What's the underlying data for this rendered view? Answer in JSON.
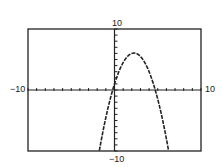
{
  "chart_data": {
    "type": "line",
    "title": "",
    "xlabel": "",
    "ylabel": "",
    "xlim": [
      -10,
      10
    ],
    "ylim": [
      -10,
      10
    ],
    "xscale_tick": 1,
    "yscale_tick": 1,
    "grid": false,
    "legend": null,
    "labels": {
      "xmin": "−10",
      "xmax": "10",
      "ymin": "−10",
      "ymax": "10"
    },
    "series": [
      {
        "name": "f(x)",
        "style": "dashed-pixel",
        "description": "Downward-opening parabola, vertex approx (2.25, 6.06), x-intercepts approx -0.25 and 4.75",
        "x": [
          -1.8,
          -1,
          -0.25,
          0,
          1,
          2,
          2.25,
          3,
          4,
          4.75,
          5,
          6,
          6.2
        ],
        "y": [
          -10,
          -4.5,
          0,
          1,
          4.5,
          6,
          6.06,
          5.5,
          3,
          0,
          -1.5,
          -8,
          -9.4
        ]
      }
    ],
    "colors": {
      "axis": "#222222",
      "curve": "#222222",
      "frame": "#222222",
      "background": "#ffffff"
    }
  }
}
